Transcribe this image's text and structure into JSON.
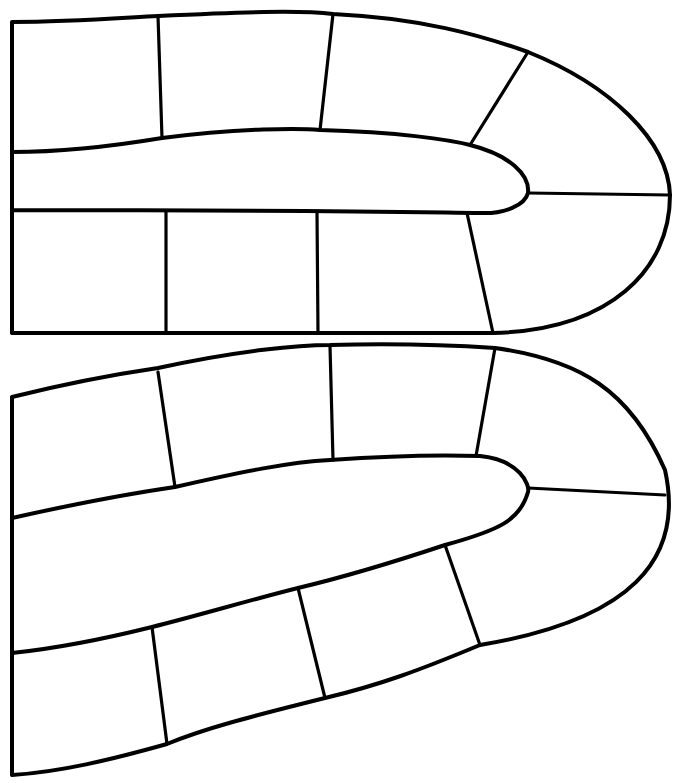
{
  "diagram": {
    "type": "board-game-path",
    "background": "#ffffff",
    "stroke_color": "#000000",
    "tracks": [
      {
        "name": "upper-track",
        "outline": "M12,22 C70,22 120,18 158,16 C240,12 300,10 333,14 C420,18 480,35 528,52 C610,85 668,140 670,195 C670,270 610,330 493,333 L12,333 Z M12,152 C70,152 120,145 162,138 C240,128 300,128 320,130 C400,132 450,140 470,145 C510,155 530,175 528,193 C525,205 505,214 480,213 C400,212 300,210 12,210 Z",
        "dividers": [
          [
            158,
            16,
            162,
            138
          ],
          [
            333,
            14,
            320,
            130
          ],
          [
            528,
            52,
            470,
            145
          ],
          [
            528,
            193,
            670,
            195
          ],
          [
            12,
            210,
            12,
            333
          ],
          [
            166,
            211,
            166,
            333
          ],
          [
            317,
            212,
            318,
            333
          ],
          [
            467,
            213,
            493,
            333
          ]
        ],
        "square_count": 9
      },
      {
        "name": "lower-track",
        "outline": "M12,397 C60,385 110,375 158,368 C240,350 300,345 330,345 C400,343 450,345 495,348 C580,360 630,390 665,470 C685,560 630,620 480,645 C420,670 380,685 325,698 C270,712 210,726 167,744 C110,760 60,772 12,775 Z",
        "inner_edge": "M12,518 C70,505 120,495 175,487 C240,472 290,462 330,460 C400,455 450,455 480,456 C520,460 530,485 528,492 C520,520 500,530 445,545 C400,560 340,578 298,588 C250,600 200,615 152,627 C100,640 60,648 12,653",
        "dividers": [
          [
            158,
            372,
            175,
            487
          ],
          [
            330,
            346,
            333,
            460
          ],
          [
            495,
            348,
            476,
            456
          ],
          [
            528,
            488,
            665,
            495
          ],
          [
            445,
            545,
            480,
            645
          ],
          [
            298,
            588,
            325,
            698
          ],
          [
            152,
            627,
            167,
            744
          ],
          [
            12,
            653,
            12,
            775
          ],
          [
            12,
            397,
            12,
            518
          ]
        ],
        "square_count": 9
      }
    ]
  }
}
